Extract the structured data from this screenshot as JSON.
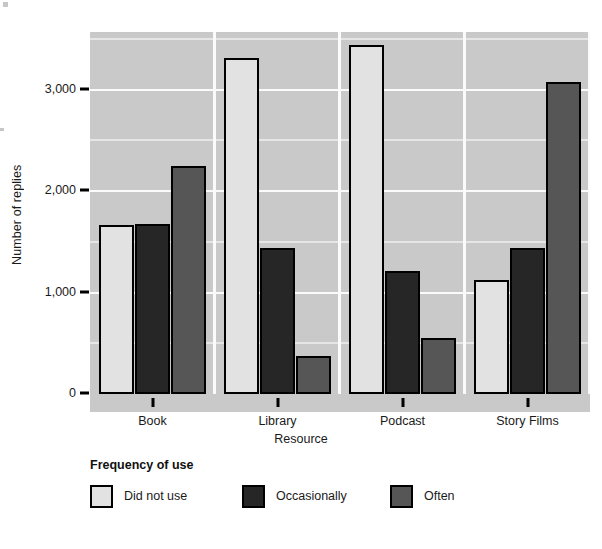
{
  "chart_data": {
    "type": "bar",
    "title": "",
    "xlabel": "Resource",
    "ylabel": "Number of replies",
    "categories": [
      "Book",
      "Library",
      "Podcast",
      "Story Films"
    ],
    "series": [
      {
        "name": "Did not use",
        "color": "#e2e2e2",
        "values": [
          1660,
          3300,
          3430,
          1110
        ]
      },
      {
        "name": "Occasionally",
        "color": "#262626",
        "values": [
          1665,
          1430,
          1200,
          1435
        ]
      },
      {
        "name": "Often",
        "color": "#565656",
        "values": [
          2235,
          365,
          545,
          3070
        ]
      }
    ],
    "ylim": [
      0,
      3560
    ],
    "yticks": [
      0,
      1000,
      2000,
      3000
    ],
    "ytick_labels": [
      "0",
      "1,000",
      "2,000",
      "3,000"
    ],
    "yminor_ticks": [
      500,
      1500,
      2500,
      3500
    ],
    "grid": true,
    "legend_title": "Frequency of use",
    "legend_position": "bottom-left",
    "plot_background": "#c9c9c9",
    "gridline_color": "#fbfbfb",
    "bar_edge_color": "#000000"
  },
  "axes": {
    "y_title": "Number of replies",
    "x_title": "Resource",
    "y_tick_labels": [
      "3,000",
      "2,000",
      "1,000",
      "0"
    ],
    "x_tick_labels": [
      "Book",
      "Library",
      "Podcast",
      "Story Films"
    ]
  },
  "legend": {
    "title": "Frequency of use",
    "items": [
      {
        "label": "Did not use",
        "color": "#e2e2e2"
      },
      {
        "label": "Occasionally",
        "color": "#262626"
      },
      {
        "label": "Often",
        "color": "#565656"
      }
    ]
  }
}
